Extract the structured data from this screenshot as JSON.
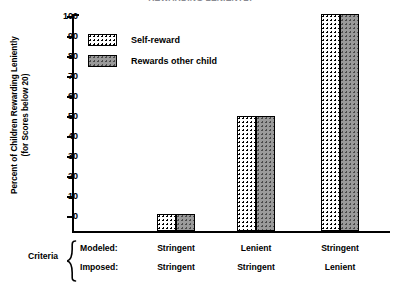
{
  "figure": {
    "title_partial": "REWARDING LENIENTLY",
    "criteria_label": "Criteria",
    "row_labels": [
      "Modeled:",
      "Imposed:"
    ]
  },
  "chart_data": {
    "type": "bar",
    "title": "REWARDING LENIENTLY",
    "xlabel": "Criteria",
    "ylabel": "Percent of Children Rewarding Leniently (for Scores below 20)",
    "ylabel_line1": "Percent of Children Rewarding Leniently",
    "ylabel_line2": "(for Scores below 20)",
    "ylim": [
      0,
      100
    ],
    "yticks": [
      0,
      10,
      20,
      30,
      40,
      50,
      60,
      70,
      80,
      90,
      100
    ],
    "ytick_labels": [
      "0",
      "10",
      "20",
      "30",
      "40",
      "50",
      "60",
      "70",
      "80",
      "90",
      "100"
    ],
    "grid": false,
    "legend_position": "upper-left-inside",
    "categories": [
      "Stringent / Stringent",
      "Lenient / Stringent",
      "Stringent / Lenient"
    ],
    "category_rows": {
      "modeled": [
        "Stringent",
        "Lenient",
        "Stringent"
      ],
      "imposed": [
        "Stringent",
        "Stringent",
        "Lenient"
      ]
    },
    "series": [
      {
        "name": "Self-reward",
        "values": [
          0,
          49,
          100
        ],
        "fill": "white-dotted",
        "color": "#ffffff",
        "edge_color": "#000000"
      },
      {
        "name": "Rewards other child",
        "values": [
          0,
          49,
          100
        ],
        "fill": "gray-dotted",
        "color": "#9a9a9a",
        "edge_color": "#000000"
      }
    ]
  }
}
